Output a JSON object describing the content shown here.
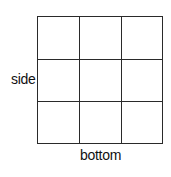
{
  "diagram": {
    "type": "grid",
    "rows": 3,
    "columns": 3,
    "labels": {
      "side": "side",
      "bottom": "bottom"
    },
    "line_color": "#2a2a2a",
    "background": "#ffffff"
  }
}
